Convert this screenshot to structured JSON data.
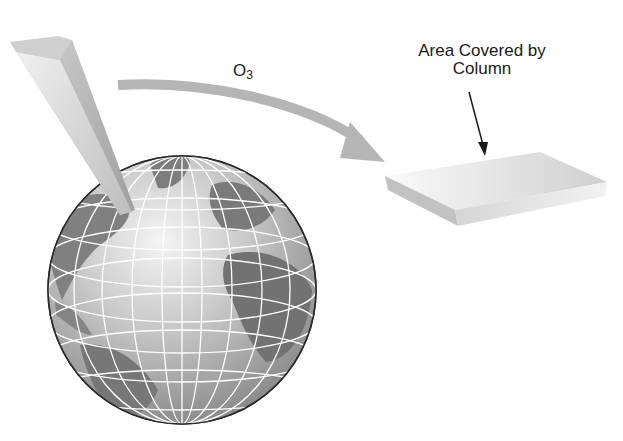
{
  "diagram": {
    "labels": {
      "molecule_base": "O",
      "molecule_subscript": "3",
      "area_line1": "Area Covered by",
      "area_line2": "Column"
    },
    "elements": [
      "globe",
      "ozone-column",
      "transfer-arrow",
      "area-slab",
      "pointer-arrow"
    ],
    "colors": {
      "column_light": "#d8d8d8",
      "column_dark": "#a9a9a9",
      "arrow": "#b5b5b5",
      "ocean": "#bdbdbd",
      "land": "#7d7d7d",
      "grid": "#ffffff",
      "slab_top": "#e2e2e2",
      "slab_side": "#bcbcbc"
    }
  }
}
